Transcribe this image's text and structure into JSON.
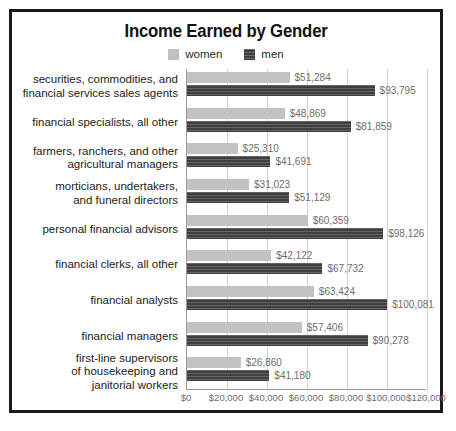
{
  "chart_data": {
    "type": "bar",
    "orientation": "horizontal",
    "title": "Income Earned by Gender",
    "xlabel": "",
    "ylabel": "",
    "xlim": [
      0,
      120000
    ],
    "grid": true,
    "legend_position": "top-center",
    "xticks": [
      "$0",
      "$20,000",
      "$40,000",
      "$60,000",
      "$80,000",
      "$100,000",
      "$120,000"
    ],
    "xtick_values": [
      0,
      20000,
      40000,
      60000,
      80000,
      100000,
      120000
    ],
    "legend": [
      {
        "name": "women",
        "color": "#c2c2c2"
      },
      {
        "name": "men",
        "color": "#3f3f3f"
      }
    ],
    "categories": [
      "securities, commodities, and\nfinancial services sales agents",
      "financial specialists, all other",
      "farmers, ranchers, and other\nagricultural managers",
      "morticians, undertakers,\nand funeral directors",
      "personal financial advisors",
      "financial clerks, all other",
      "financial analysts",
      "financial managers",
      "first-line supervisors\nof housekeeping and\njanitorial workers"
    ],
    "series": [
      {
        "name": "women",
        "values": [
          51284,
          48869,
          25310,
          31023,
          60359,
          42122,
          63424,
          57406,
          26860
        ],
        "labels": [
          "$51,284",
          "$48,869",
          "$25,310",
          "$31,023",
          "$60,359",
          "$42,122",
          "$63,424",
          "$57,406",
          "$26,860"
        ]
      },
      {
        "name": "men",
        "values": [
          93795,
          81859,
          41691,
          51129,
          98126,
          67732,
          100081,
          90278,
          41180
        ],
        "labels": [
          "$93,795",
          "$81,859",
          "$41,691",
          "$51,129",
          "$98,126",
          "$67,732",
          "$100,081",
          "$90,278",
          "$41,180"
        ]
      }
    ]
  }
}
